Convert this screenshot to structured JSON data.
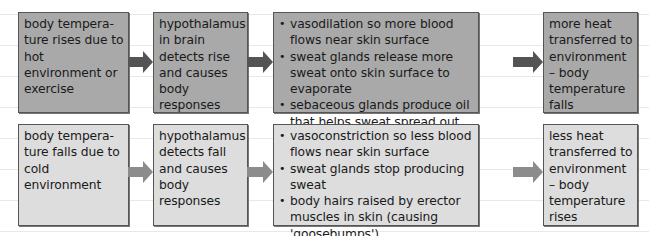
{
  "diagram": {
    "rows": [
      {
        "name": "hot",
        "fill_color": "#a9a9a9",
        "arrow_color": "#545454",
        "trigger": "body tempera-ture rises due to hot environment or exercise",
        "detection": "hypothalamus in brain detects rise and causes body responses",
        "responses": [
          "vasodilation so more blood flows near skin surface",
          "sweat glands release more sweat onto skin surface to evaporate",
          "sebaceous glands produce oil that helps sweat spread out over skin"
        ],
        "outcome": "more heat transferred to environment – body temperature falls"
      },
      {
        "name": "cold",
        "fill_color": "#dddddd",
        "arrow_color": "#8c8c8c",
        "trigger": "body tempera-ture falls due to cold environment",
        "detection": "hypothalamus detects fall and causes body responses",
        "responses": [
          "vasoconstriction so less blood flows near skin surface",
          "sweat glands stop producing sweat",
          "body hairs raised by erector muscles in skin (causing 'goosebumps')"
        ],
        "outcome": "less heat transferred to environment – body temperature rises"
      }
    ]
  }
}
